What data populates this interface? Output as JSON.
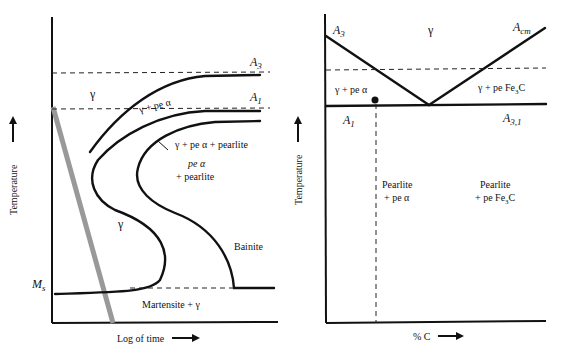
{
  "left_diagram": {
    "title": "TTT diagram",
    "x_axis_label": "Log of time",
    "y_axis_label": "Temperature",
    "lines": {
      "A3": "A",
      "A3_sub": "3",
      "A1": "A",
      "A1_sub": "1",
      "Ms": "M",
      "Ms_sub": "s"
    },
    "regions": {
      "gamma_top": "γ",
      "gamma_pe_alpha": "γ + pe α",
      "gamma_pe_alpha_pearlite": "γ + pe α  + pearlite",
      "pe_alpha_line1": "pe α",
      "pe_alpha_line2": "+ pearlite",
      "gamma_mid": "γ",
      "bainite": "Bainite",
      "martensite": "Martensite + γ"
    }
  },
  "right_diagram": {
    "title": "Phase diagram section",
    "x_axis_label": "% C",
    "y_axis_label": "Temperature",
    "lines": {
      "A3": "A",
      "A3_sub": "3",
      "Acm": "A",
      "Acm_sub": "cm",
      "A1": "A",
      "A1_sub": "1",
      "A31": "A",
      "A31_sub": "3,1"
    },
    "regions": {
      "gamma": "γ",
      "gamma_pe_alpha": "γ + pe  α",
      "gamma_pe_fe3c": "γ + pe  Fe",
      "gamma_pe_fe3c_sub": "3",
      "gamma_pe_fe3c_end": "C",
      "pearlite_alpha_line1": "Pearlite",
      "pearlite_alpha_line2": "+ pe α",
      "pearlite_fe3c_line1": "Pearlite",
      "pearlite_fe3c_line2": "+ pe Fe",
      "pearlite_fe3c_sub": "3",
      "pearlite_fe3c_end": "C"
    }
  }
}
